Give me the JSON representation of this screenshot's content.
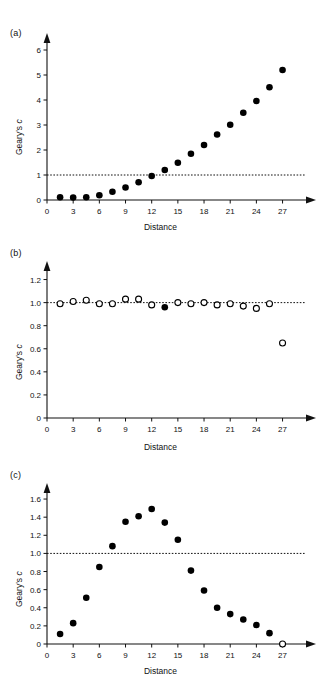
{
  "figure": {
    "panels": [
      {
        "id": "a",
        "label": "(a)",
        "xlabel": "Distance",
        "ylabel_main": "Geary's ",
        "ylabel_italic": "c"
      },
      {
        "id": "b",
        "label": "(b)",
        "xlabel": "Distance",
        "ylabel_main": "Geary's ",
        "ylabel_italic": "c"
      },
      {
        "id": "c",
        "label": "(c)",
        "xlabel": "Distance",
        "ylabel_main": "Geary's ",
        "ylabel_italic": "c"
      }
    ]
  },
  "chart_data": [
    {
      "type": "scatter",
      "panel": "a",
      "title": "(a)",
      "xlabel": "Distance",
      "ylabel": "Geary's c",
      "xlim": [
        0,
        29
      ],
      "ylim": [
        0,
        6.4
      ],
      "xticks": [
        0,
        3,
        6,
        9,
        12,
        15,
        18,
        21,
        24,
        27
      ],
      "yticks": [
        0,
        1,
        2,
        3,
        4,
        5,
        6
      ],
      "xtick_labels": [
        "0",
        "3",
        "6",
        "9",
        "12",
        "15",
        "18",
        "21",
        "24",
        "27"
      ],
      "ytick_labels": [
        "0",
        "1",
        "2",
        "3",
        "4",
        "5",
        "6"
      ],
      "grid": false,
      "legend": null,
      "reference_line": {
        "axis": "y",
        "value": 1.0,
        "style": "dotted"
      },
      "series": [
        {
          "name": "Geary's c",
          "marker": "filled-circle",
          "x": [
            1.5,
            3,
            4.5,
            6,
            7.5,
            9,
            10.5,
            12,
            13.5,
            15,
            16.5,
            18,
            19.5,
            21,
            22.5,
            24,
            25.5,
            27
          ],
          "y": [
            0.11,
            0.1,
            0.11,
            0.19,
            0.33,
            0.5,
            0.71,
            0.96,
            1.2,
            1.49,
            1.85,
            2.2,
            2.62,
            3.01,
            3.49,
            3.96,
            4.51,
            5.2
          ]
        }
      ]
    },
    {
      "type": "scatter",
      "panel": "b",
      "title": "(b)",
      "xlabel": "Distance",
      "ylabel": "Geary's c",
      "xlim": [
        0,
        29
      ],
      "ylim": [
        0,
        1.3
      ],
      "xticks": [
        0,
        3,
        6,
        9,
        12,
        15,
        18,
        21,
        24,
        27
      ],
      "yticks": [
        0,
        0.2,
        0.4,
        0.6,
        0.8,
        1.0,
        1.2
      ],
      "xtick_labels": [
        "0",
        "3",
        "6",
        "9",
        "12",
        "15",
        "18",
        "21",
        "24",
        "27"
      ],
      "ytick_labels": [
        "0",
        "0.2",
        "0.4",
        "0.6",
        "0.8",
        "1.0",
        "1.2"
      ],
      "grid": false,
      "legend": null,
      "reference_line": {
        "axis": "y",
        "value": 1.0,
        "style": "dotted"
      },
      "series": [
        {
          "name": "Geary's c (non-significant)",
          "marker": "open-circle",
          "x": [
            1.5,
            3,
            4.5,
            6,
            7.5,
            9,
            10.5,
            12,
            15,
            16.5,
            18,
            19.5,
            21,
            22.5,
            24,
            25.5,
            27
          ],
          "y": [
            0.99,
            1.01,
            1.02,
            0.99,
            0.99,
            1.03,
            1.03,
            0.98,
            1.0,
            0.99,
            1.0,
            0.98,
            0.99,
            0.97,
            0.95,
            0.99,
            0.65
          ]
        },
        {
          "name": "Geary's c (significant)",
          "marker": "filled-circle",
          "x": [
            13.5
          ],
          "y": [
            0.96
          ]
        }
      ]
    },
    {
      "type": "scatter",
      "panel": "c",
      "title": "(c)",
      "xlabel": "Distance",
      "ylabel": "Geary's c",
      "xlim": [
        0,
        29
      ],
      "ylim": [
        0,
        1.7
      ],
      "xticks": [
        0,
        3,
        6,
        9,
        12,
        15,
        18,
        21,
        24,
        27
      ],
      "yticks": [
        0,
        0.2,
        0.4,
        0.6,
        0.8,
        1.0,
        1.2,
        1.4,
        1.6
      ],
      "xtick_labels": [
        "0",
        "3",
        "6",
        "9",
        "12",
        "15",
        "18",
        "21",
        "24",
        "27"
      ],
      "ytick_labels": [
        "0",
        "0.2",
        "0.4",
        "0.6",
        "0.8",
        "1.0",
        "1.2",
        "1.4",
        "1.6"
      ],
      "grid": false,
      "legend": null,
      "reference_line": {
        "axis": "y",
        "value": 1.0,
        "style": "dotted"
      },
      "series": [
        {
          "name": "Geary's c (significant)",
          "marker": "filled-circle",
          "x": [
            1.5,
            3,
            4.5,
            6,
            7.5,
            9,
            10.5,
            12,
            13.5,
            15,
            16.5,
            18,
            19.5,
            21,
            22.5,
            24,
            25.5
          ],
          "y": [
            0.11,
            0.23,
            0.51,
            0.85,
            1.08,
            1.35,
            1.41,
            1.49,
            1.34,
            1.15,
            0.81,
            0.59,
            0.4,
            0.33,
            0.27,
            0.21,
            0.12
          ]
        },
        {
          "name": "Geary's c (non-significant)",
          "marker": "open-circle",
          "x": [
            27
          ],
          "y": [
            0.0
          ]
        }
      ]
    }
  ]
}
